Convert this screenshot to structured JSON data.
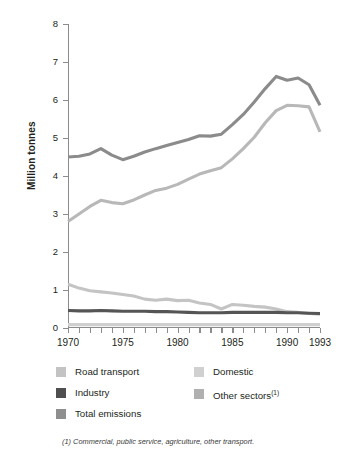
{
  "chart_data": {
    "type": "line",
    "title": "",
    "xlabel": "",
    "ylabel": "Million tonnes",
    "xlim": [
      1970,
      1993
    ],
    "ylim": [
      0,
      8
    ],
    "grid": false,
    "legend_position": "bottom",
    "x": [
      1970,
      1971,
      1972,
      1973,
      1974,
      1975,
      1976,
      1977,
      1978,
      1979,
      1980,
      1981,
      1982,
      1983,
      1984,
      1985,
      1986,
      1987,
      1988,
      1989,
      1990,
      1991,
      1992,
      1993
    ],
    "y_ticks": [
      "0",
      "1",
      "2",
      "3",
      "4",
      "5",
      "6",
      "7",
      "8"
    ],
    "x_ticks": [
      "1970",
      "1975",
      "1980",
      "1985",
      "1990",
      "1993"
    ],
    "series": [
      {
        "name": "Total emissions",
        "color": "#8b8b8b",
        "values": [
          4.5,
          4.52,
          4.58,
          4.72,
          4.55,
          4.43,
          4.52,
          4.63,
          4.72,
          4.8,
          4.88,
          4.96,
          5.06,
          5.05,
          5.1,
          5.35,
          5.62,
          5.95,
          6.3,
          6.62,
          6.52,
          6.58,
          6.4,
          5.86
        ]
      },
      {
        "name": "Road transport",
        "color": "#b8b8b8",
        "values": [
          2.8,
          3.0,
          3.2,
          3.36,
          3.3,
          3.27,
          3.37,
          3.5,
          3.62,
          3.68,
          3.78,
          3.92,
          4.05,
          4.14,
          4.22,
          4.45,
          4.72,
          5.02,
          5.4,
          5.72,
          5.86,
          5.85,
          5.82,
          5.16
        ]
      },
      {
        "name": "Other sectors",
        "color": "#c4c4c4",
        "values": [
          1.15,
          1.05,
          0.98,
          0.95,
          0.92,
          0.88,
          0.84,
          0.76,
          0.73,
          0.76,
          0.72,
          0.73,
          0.66,
          0.62,
          0.5,
          0.62,
          0.6,
          0.57,
          0.55,
          0.5,
          0.43,
          0.41,
          0.38,
          0.36
        ]
      },
      {
        "name": "Industry",
        "color": "#555555",
        "values": [
          0.46,
          0.45,
          0.45,
          0.46,
          0.45,
          0.44,
          0.44,
          0.44,
          0.43,
          0.43,
          0.42,
          0.41,
          0.4,
          0.4,
          0.4,
          0.41,
          0.41,
          0.41,
          0.41,
          0.41,
          0.4,
          0.4,
          0.39,
          0.38
        ]
      },
      {
        "name": "Domestic",
        "color": "#cfcfcf",
        "values": [
          0.09,
          0.09,
          0.09,
          0.09,
          0.09,
          0.09,
          0.09,
          0.09,
          0.09,
          0.09,
          0.09,
          0.09,
          0.09,
          0.09,
          0.09,
          0.09,
          0.09,
          0.09,
          0.09,
          0.09,
          0.09,
          0.09,
          0.09,
          0.09
        ]
      }
    ]
  },
  "axis": {
    "y_title": "Million tonnes"
  },
  "legend": {
    "items": [
      {
        "label": "Road transport",
        "color": "#c3c3c3",
        "note": ""
      },
      {
        "label": "Industry",
        "color": "#4f4f4f",
        "note": ""
      },
      {
        "label": "Total emissions",
        "color": "#8e8e8e",
        "note": ""
      },
      {
        "label": "Domestic",
        "color": "#d0d0d0",
        "note": ""
      },
      {
        "label": "Other sectors",
        "color": "#b0b0b0",
        "note": "(1)"
      }
    ]
  },
  "footnote": {
    "text": "(1) Commercial, public service, agriculture, other transport."
  }
}
